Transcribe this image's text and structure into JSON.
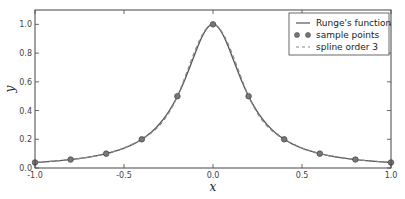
{
  "chart_data": {
    "type": "line",
    "title": "",
    "xlabel": "x",
    "ylabel": "y",
    "xlim": [
      -1.0,
      1.0
    ],
    "ylim": [
      0.0,
      1.1
    ],
    "grid": false,
    "legend_position": "upper right",
    "xticks": [
      "-1.0",
      "-0.5",
      "0.0",
      "0.5",
      "1.0"
    ],
    "yticks": [
      "0.0",
      "0.2",
      "0.4",
      "0.6",
      "0.8",
      "1.0"
    ],
    "series": [
      {
        "name": "Runge's function",
        "style": "solid line",
        "color": "#555555",
        "function": "1/(1+25x^2)"
      },
      {
        "name": "sample points",
        "style": "markers",
        "color": "#555555",
        "x": [
          -1.0,
          -0.8,
          -0.6,
          -0.4,
          -0.2,
          0.0,
          0.2,
          0.4,
          0.6,
          0.8,
          1.0
        ],
        "y": [
          0.038,
          0.059,
          0.1,
          0.2,
          0.5,
          1.0,
          0.5,
          0.2,
          0.1,
          0.059,
          0.038
        ]
      },
      {
        "name": "spline order 3",
        "style": "dashed line",
        "color": "#888888",
        "function": "cubic spline through sample points"
      }
    ]
  },
  "legend": {
    "items": [
      "Runge's function",
      "sample points",
      "spline order 3"
    ]
  },
  "axes": {
    "xlabel": "x",
    "ylabel": "y"
  }
}
